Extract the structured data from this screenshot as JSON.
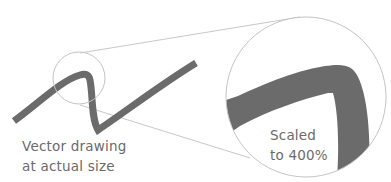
{
  "diagram": {
    "left_caption": {
      "line1": "Vector drawing",
      "line2": "at actual size"
    },
    "right_caption": {
      "line1": "Scaled",
      "line2": "to 400%"
    },
    "colors": {
      "stroke": "#6b6b6b",
      "guide": "#c4c4c4",
      "text": "#6a6a6a",
      "background": "#ffffff"
    },
    "zoom_factor": "400%"
  }
}
